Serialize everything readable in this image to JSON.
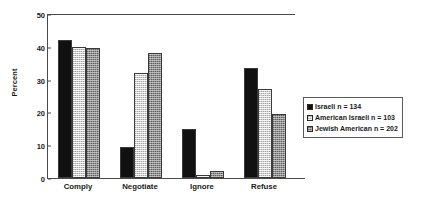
{
  "chart_data": {
    "type": "bar",
    "title": "",
    "xlabel": "",
    "ylabel": "Percent",
    "ylim": [
      0,
      50
    ],
    "yticks": [
      0,
      10,
      20,
      30,
      40,
      50
    ],
    "grid": false,
    "legend_position": "right",
    "categories": [
      "Comply",
      "Negotiate",
      "Ignore",
      "Refuse"
    ],
    "series": [
      {
        "name": "Israeli  n = 134",
        "label": "Israeli",
        "n": 134,
        "color": "#111111",
        "values": [
          42,
          9.5,
          15,
          33.5
        ]
      },
      {
        "name": "American  Israeli  n = 103",
        "label": "American  Israeli",
        "n": 103,
        "color": "#d2d2d2",
        "values": [
          39.8,
          32,
          0.8,
          27
        ]
      },
      {
        "name": "Jewish  American  n = 202",
        "label": "Jewish  American",
        "n": 202,
        "color": "#8e8e8e",
        "values": [
          39.7,
          38,
          2,
          19.5
        ]
      }
    ]
  },
  "legend": {
    "entries": [
      "Israeli  n = 134",
      "American  Israeli  n = 103",
      "Jewish  American  n = 202"
    ]
  }
}
